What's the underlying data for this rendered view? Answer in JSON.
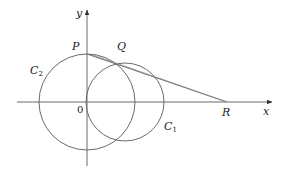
{
  "diagram": {
    "type": "geometry",
    "axes": {
      "x_label": "x",
      "y_label": "y",
      "origin_label": "0"
    },
    "circles": [
      {
        "name": "C2",
        "label_main": "C",
        "label_sub": "2",
        "cx": 87,
        "cy": 102,
        "r": 48
      },
      {
        "name": "C1",
        "label_main": "C",
        "label_sub": "1",
        "cx": 125,
        "cy": 102,
        "r": 39
      }
    ],
    "points": {
      "P": {
        "label": "P",
        "x": 87,
        "y": 54
      },
      "Q": {
        "label": "Q",
        "x": 115,
        "y": 64
      },
      "R": {
        "label": "R",
        "x": 227,
        "y": 102
      }
    },
    "lines": [
      {
        "name": "line-PR",
        "from": "P",
        "to": "R"
      }
    ],
    "colors": {
      "stroke": "#6a6a6a",
      "text": "#222222"
    }
  }
}
